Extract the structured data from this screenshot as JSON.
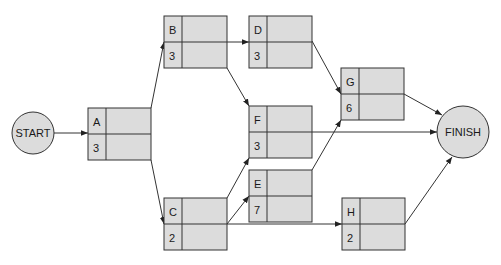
{
  "diagram": {
    "type": "activity-on-node network",
    "colors": {
      "node_fill": "#dcdcdc",
      "stroke": "#333333",
      "background": "#ffffff"
    },
    "start": {
      "label": "START",
      "cx": 33,
      "cy": 133,
      "r": 21
    },
    "finish": {
      "label": "FINISH",
      "cx": 463,
      "cy": 132,
      "r": 26
    },
    "activities": [
      {
        "id": "A",
        "duration": "3",
        "x": 88,
        "y": 108
      },
      {
        "id": "B",
        "duration": "3",
        "x": 164,
        "y": 16
      },
      {
        "id": "C",
        "duration": "2",
        "x": 164,
        "y": 198
      },
      {
        "id": "D",
        "duration": "3",
        "x": 249,
        "y": 16
      },
      {
        "id": "E",
        "duration": "7",
        "x": 249,
        "y": 170
      },
      {
        "id": "F",
        "duration": "3",
        "x": 249,
        "y": 106
      },
      {
        "id": "G",
        "duration": "6",
        "x": 341,
        "y": 68
      },
      {
        "id": "H",
        "duration": "2",
        "x": 342,
        "y": 198
      }
    ],
    "edges": [
      {
        "from": "START",
        "to": "A"
      },
      {
        "from": "A",
        "to": "B"
      },
      {
        "from": "A",
        "to": "C"
      },
      {
        "from": "B",
        "to": "D"
      },
      {
        "from": "B",
        "to": "F"
      },
      {
        "from": "C",
        "to": "F"
      },
      {
        "from": "C",
        "to": "E"
      },
      {
        "from": "C",
        "to": "H"
      },
      {
        "from": "D",
        "to": "G"
      },
      {
        "from": "E",
        "to": "G"
      },
      {
        "from": "F",
        "to": "FINISH"
      },
      {
        "from": "G",
        "to": "FINISH"
      },
      {
        "from": "H",
        "to": "FINISH"
      }
    ]
  }
}
